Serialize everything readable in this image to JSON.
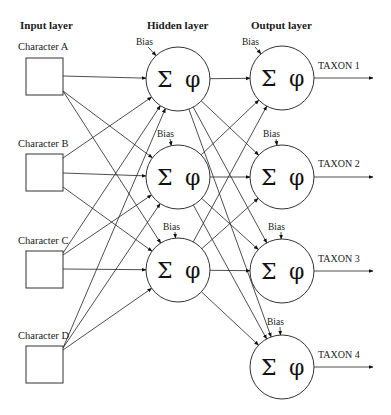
{
  "diagram": {
    "layer_titles": {
      "input": "Input layer",
      "hidden": "Hidden layer",
      "output": "Output layer"
    },
    "inputs": [
      {
        "id": "A",
        "label": "Character A"
      },
      {
        "id": "B",
        "label": "Character B"
      },
      {
        "id": "C",
        "label": "Character C"
      },
      {
        "id": "D",
        "label": "Character D"
      }
    ],
    "hidden": [
      {
        "id": "H1",
        "bias_label": "Bias",
        "sum_symbol": "Σ",
        "activation_symbol": "φ"
      },
      {
        "id": "H2",
        "bias_label": "Bias",
        "sum_symbol": "Σ",
        "activation_symbol": "φ"
      },
      {
        "id": "H3",
        "bias_label": "Bias",
        "sum_symbol": "Σ",
        "activation_symbol": "φ"
      }
    ],
    "outputs": [
      {
        "id": "O1",
        "bias_label": "Bias",
        "sum_symbol": "Σ",
        "activation_symbol": "φ",
        "taxon": "TAXON 1"
      },
      {
        "id": "O2",
        "bias_label": "Bias",
        "sum_symbol": "Σ",
        "activation_symbol": "φ",
        "taxon": "TAXON 2"
      },
      {
        "id": "O3",
        "bias_label": "Bias",
        "sum_symbol": "Σ",
        "activation_symbol": "φ",
        "taxon": "TAXON 3"
      },
      {
        "id": "O4",
        "bias_label": "Bias",
        "sum_symbol": "Σ",
        "activation_symbol": "φ",
        "taxon": "TAXON 4"
      }
    ],
    "connections": "fully-connected: every input to every hidden node, every hidden node to every output node"
  }
}
